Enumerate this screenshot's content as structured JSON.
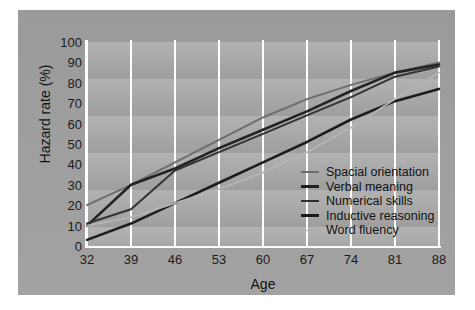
{
  "chart_data": {
    "type": "line",
    "title": "",
    "xlabel": "Age",
    "ylabel": "Hazard rate (%)",
    "x": [
      32,
      39,
      46,
      53,
      60,
      67,
      74,
      81,
      88
    ],
    "xlim": [
      32,
      88
    ],
    "ylim": [
      0,
      100
    ],
    "yticks": [
      0,
      10,
      20,
      30,
      40,
      50,
      60,
      70,
      80,
      90,
      100
    ],
    "xticks": [
      32,
      39,
      46,
      53,
      60,
      67,
      74,
      81,
      88
    ],
    "grid": "vertical white gridlines at each x tick; horizontal banded background",
    "legend_position": "inside right-center",
    "series": [
      {
        "name": "Spacial orientation",
        "color": "#6e6e6e",
        "width": 2.0,
        "values": [
          20,
          30,
          41,
          52,
          63,
          72,
          79,
          85,
          90
        ]
      },
      {
        "name": "Verbal meaning",
        "color": "#232323",
        "width": 2.6,
        "values": [
          10,
          30,
          38,
          48,
          57,
          66,
          76,
          85,
          89
        ]
      },
      {
        "name": "Numerical skills",
        "color": "#333333",
        "width": 2.0,
        "values": [
          11,
          18,
          37,
          46,
          55,
          64,
          73,
          83,
          88
        ]
      },
      {
        "name": "Inductive reasoning",
        "color": "#1d1d1d",
        "width": 2.6,
        "values": [
          3,
          11,
          21,
          31,
          41,
          51,
          62,
          71,
          77
        ]
      },
      {
        "name": "Word fluency",
        "color": "#b4b4b4",
        "width": 1.8,
        "values": [
          10,
          14,
          21,
          28,
          36,
          46,
          58,
          72,
          85
        ]
      }
    ]
  },
  "axes": {
    "y_label": "Hazard rate (%)",
    "x_label": "Age",
    "y_tick_labels": [
      "100",
      "90",
      "80",
      "70",
      "60",
      "50",
      "40",
      "30",
      "20",
      "10",
      "0"
    ],
    "x_tick_labels": [
      "32",
      "39",
      "46",
      "53",
      "60",
      "67",
      "74",
      "81",
      "88"
    ]
  },
  "legend": {
    "items": [
      {
        "label": "Spacial orientation",
        "color": "#6e6e6e",
        "width": "2px"
      },
      {
        "label": "Verbal meaning",
        "color": "#1f1f1f",
        "width": "3px"
      },
      {
        "label": "Numerical skills",
        "color": "#2e2e2e",
        "width": "2px"
      },
      {
        "label": "Inductive reasoning",
        "color": "#1a1a1a",
        "width": "3px"
      },
      {
        "label": "Word fluency",
        "color": "#b0b0b0",
        "width": "1px"
      }
    ]
  },
  "colors": {
    "panel_background": "#9e9e9e",
    "plot_background": "#a5a5a5",
    "gridline": "#fdfdfd",
    "text": "#141414"
  }
}
